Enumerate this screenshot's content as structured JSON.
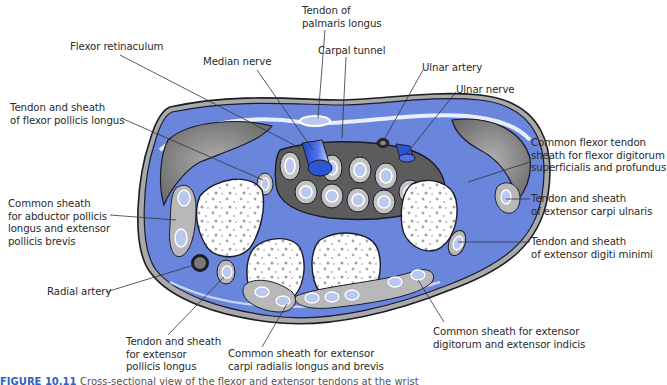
{
  "figure": {
    "caption_label": "FIGURE 10.11",
    "caption_text": "Cross-sectional view of the flexor and extensor tendons at the wrist"
  },
  "labels": [
    {
      "id": "tendon-palmaris-longus",
      "text": "Tendon of\npalmaris longus",
      "x": 302,
      "y": 5
    },
    {
      "id": "flexor-retinaculum",
      "text": "Flexor retinaculum",
      "x": 70,
      "y": 41
    },
    {
      "id": "carpal-tunnel",
      "text": "Carpal tunnel",
      "x": 318,
      "y": 45
    },
    {
      "id": "median-nerve",
      "text": "Median nerve",
      "x": 203,
      "y": 56
    },
    {
      "id": "ulnar-artery",
      "text": "Ulnar artery",
      "x": 422,
      "y": 62
    },
    {
      "id": "ulnar-nerve",
      "text": "Ulnar nerve",
      "x": 456,
      "y": 84
    },
    {
      "id": "tendon-flexor-pollicis-longus",
      "text": "Tendon and sheath\nof flexor pollicis longus",
      "x": 10,
      "y": 102
    },
    {
      "id": "common-flexor-tendon-sheath",
      "text": "Common flexor tendon\nsheath for flexor digitorum\nsuperficialis and profundus",
      "x": 531,
      "y": 137
    },
    {
      "id": "common-sheath-abductor-pollicis",
      "text": "Common sheath\nfor abductor pollicis\nlongus and extensor\npollicis brevis",
      "x": 8,
      "y": 198
    },
    {
      "id": "tendon-extensor-carpi-ulnaris",
      "text": "Tendon and sheath\nof extensor carpi ulnaris",
      "x": 531,
      "y": 195
    },
    {
      "id": "tendon-extensor-digiti-minimi",
      "text": "Tendon and sheath\nof extensor digiti minimi",
      "x": 531,
      "y": 238
    },
    {
      "id": "radial-artery",
      "text": "Radial artery",
      "x": 47,
      "y": 287
    },
    {
      "id": "common-sheath-extensor-digitorum",
      "text": "Common sheath for extensor\ndigitorum and extensor indicis",
      "x": 433,
      "y": 328
    },
    {
      "id": "tendon-extensor-pollicis-longus",
      "text": "Tendon and sheath\nfor extensor\npollicis longus",
      "x": 126,
      "y": 338
    },
    {
      "id": "common-sheath-extensor-carpi-radialis",
      "text": "Common sheath for extensor\ncarpi radialis longus and brevis",
      "x": 228,
      "y": 350
    }
  ],
  "colors": {
    "tissue_blue": "#6a86dc",
    "light_blue": "#b9c8ef",
    "bone": "#ffffff",
    "bone_speckle": "#a9a9a9",
    "sheath_gray": "#b8b8b8",
    "muscle_gray": "#8c8c8c",
    "dark_gray": "#5a5a5a",
    "outline": "#1b1b2a",
    "nerve_blue": "#2f55d4",
    "caption_blue": "#2a63c6"
  }
}
